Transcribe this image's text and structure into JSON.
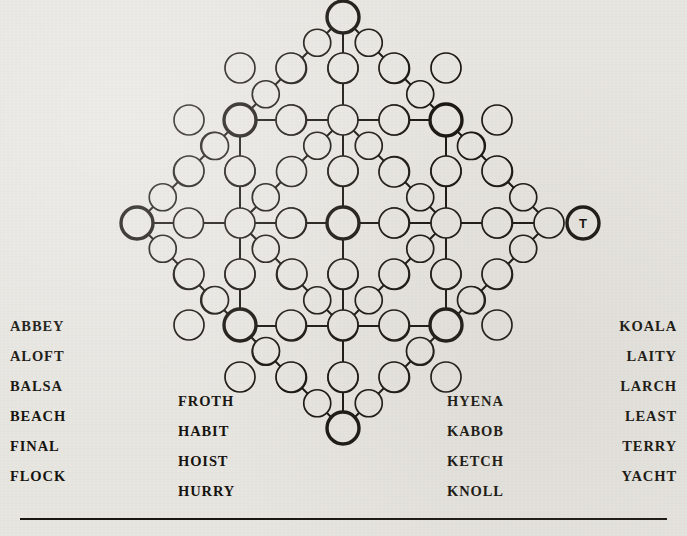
{
  "puzzle": {
    "type": "word-lattice-grid",
    "background_color": "#e9e7e2",
    "ink_color": "#1a1712",
    "node_fill": "#e9e7e2",
    "geometry": {
      "center": [
        343,
        223
      ],
      "step": 51.5,
      "node_radius": 15,
      "bold_node_radius": 16,
      "small_node_radius": 13.5
    },
    "labeled_nodes": [
      {
        "id": "right-vertex",
        "label": "T",
        "x": 583,
        "y": 223
      }
    ],
    "bold_nodes": [
      {
        "id": "top-vertex",
        "x": 343,
        "y": 17
      },
      {
        "id": "upper-left",
        "x": 240,
        "y": 120
      },
      {
        "id": "upper-right",
        "x": 446,
        "y": 120
      },
      {
        "id": "left-vertex",
        "x": 137,
        "y": 223
      },
      {
        "id": "center",
        "x": 343,
        "y": 223
      },
      {
        "id": "right-vertex",
        "x": 583,
        "y": 223
      },
      {
        "id": "lower-left",
        "x": 240,
        "y": 325
      },
      {
        "id": "lower-right",
        "x": 446,
        "y": 325
      },
      {
        "id": "bottom-vertex",
        "x": 343,
        "y": 428
      }
    ],
    "plain_nodes": [
      {
        "x": 343,
        "y": 68
      },
      {
        "x": 343,
        "y": 120
      },
      {
        "x": 343,
        "y": 171
      },
      {
        "x": 343,
        "y": 274
      },
      {
        "x": 343,
        "y": 325
      },
      {
        "x": 343,
        "y": 377
      },
      {
        "x": 189,
        "y": 223
      },
      {
        "x": 240,
        "y": 223
      },
      {
        "x": 291,
        "y": 223
      },
      {
        "x": 394,
        "y": 223
      },
      {
        "x": 446,
        "y": 223
      },
      {
        "x": 497,
        "y": 223
      },
      {
        "x": 291,
        "y": 120
      },
      {
        "x": 394,
        "y": 120
      },
      {
        "x": 291,
        "y": 325
      },
      {
        "x": 394,
        "y": 325
      },
      {
        "x": 240,
        "y": 171
      },
      {
        "x": 240,
        "y": 274
      },
      {
        "x": 446,
        "y": 171
      },
      {
        "x": 446,
        "y": 274
      },
      {
        "x": 291,
        "y": 68
      },
      {
        "x": 394,
        "y": 68
      },
      {
        "x": 291,
        "y": 377
      },
      {
        "x": 394,
        "y": 377
      },
      {
        "x": 189,
        "y": 171
      },
      {
        "x": 189,
        "y": 274
      },
      {
        "x": 497,
        "y": 171
      },
      {
        "x": 497,
        "y": 274
      },
      {
        "x": 266,
        "y": 94
      },
      {
        "x": 420,
        "y": 94
      },
      {
        "x": 266,
        "y": 351
      },
      {
        "x": 420,
        "y": 351
      },
      {
        "x": 215,
        "y": 146
      },
      {
        "x": 471,
        "y": 146
      },
      {
        "x": 215,
        "y": 300
      },
      {
        "x": 471,
        "y": 300
      },
      {
        "x": 317,
        "y": 43
      },
      {
        "x": 369,
        "y": 43
      },
      {
        "x": 317,
        "y": 403
      },
      {
        "x": 369,
        "y": 403
      },
      {
        "x": 163,
        "y": 197
      },
      {
        "x": 163,
        "y": 249
      },
      {
        "x": 523,
        "y": 197
      },
      {
        "x": 523,
        "y": 249
      },
      {
        "x": 292,
        "y": 172
      },
      {
        "x": 394,
        "y": 172
      },
      {
        "x": 292,
        "y": 274
      },
      {
        "x": 394,
        "y": 274
      },
      {
        "x": 189,
        "y": 120
      },
      {
        "x": 497,
        "y": 120
      },
      {
        "x": 189,
        "y": 325
      },
      {
        "x": 497,
        "y": 325
      },
      {
        "x": 240,
        "y": 68
      },
      {
        "x": 446,
        "y": 68
      },
      {
        "x": 240,
        "y": 377
      },
      {
        "x": 446,
        "y": 377
      }
    ]
  },
  "word_columns": [
    {
      "id": "column-1",
      "words": [
        "ABBEY",
        "ALOFT",
        "BALSA",
        "BEACH",
        "FINAL",
        "FLOCK"
      ]
    },
    {
      "id": "column-2",
      "words": [
        "FROTH",
        "HABIT",
        "HOIST",
        "HURRY"
      ]
    },
    {
      "id": "column-3",
      "words": [
        "HYENA",
        "KABOB",
        "KETCH",
        "KNOLL"
      ]
    },
    {
      "id": "column-4",
      "words": [
        "KOALA",
        "LAITY",
        "LARCH",
        "LEAST",
        "TERRY",
        "YACHT"
      ]
    }
  ]
}
